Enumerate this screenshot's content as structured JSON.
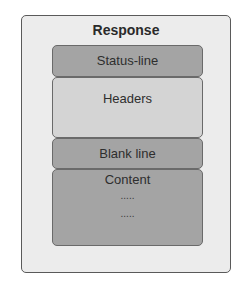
{
  "diagram": {
    "title": "Response",
    "sections": [
      {
        "label": "Status-line"
      },
      {
        "label": "Headers"
      },
      {
        "label": "Blank line"
      },
      {
        "label": "Content",
        "lines": [
          ".....",
          "....."
        ]
      }
    ]
  },
  "colors": {
    "outer_background": "#ececec",
    "dark_section": "#a4a4a4",
    "light_section": "#d4d4d4",
    "border": "#5a5a5a"
  }
}
